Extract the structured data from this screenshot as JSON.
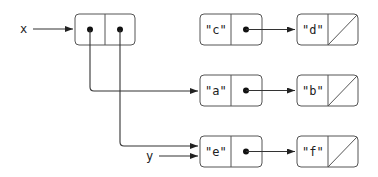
{
  "diagram": {
    "type": "box-and-pointer",
    "variables": [
      {
        "name": "x",
        "points_to": "pair-x"
      },
      {
        "name": "y",
        "points_to": "cell-e"
      }
    ],
    "pair_x": {
      "car": "cell-a",
      "cdr": "cell-e"
    },
    "cells": [
      {
        "id": "cell-c",
        "car": "\"c\"",
        "cdr": "cell-d"
      },
      {
        "id": "cell-d",
        "car": "\"d\"",
        "cdr": "nil"
      },
      {
        "id": "cell-a",
        "car": "\"a\"",
        "cdr": "cell-b"
      },
      {
        "id": "cell-b",
        "car": "\"b\"",
        "cdr": "nil"
      },
      {
        "id": "cell-e",
        "car": "\"e\"",
        "cdr": "cell-f"
      },
      {
        "id": "cell-f",
        "car": "\"f\"",
        "cdr": "nil"
      }
    ],
    "labels": {
      "x": "x",
      "y": "y",
      "c": "\"c\"",
      "d": "\"d\"",
      "a": "\"a\"",
      "b": "\"b\"",
      "e": "\"e\"",
      "f": "\"f\""
    }
  }
}
